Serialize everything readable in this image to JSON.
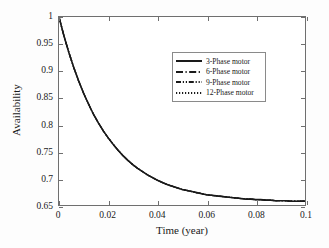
{
  "chart_data": {
    "type": "line",
    "title": "",
    "xlabel": "Time (year)",
    "ylabel": "Availability",
    "xlim": [
      0,
      0.1
    ],
    "ylim": [
      0.65,
      1
    ],
    "xticks": [
      0,
      0.02,
      0.04,
      0.06,
      0.08,
      0.1
    ],
    "xticklabels": [
      "0",
      "0.02",
      "0.04",
      "0.06",
      "0.08",
      "0.1"
    ],
    "yticks": [
      0.65,
      0.7,
      0.75,
      0.8,
      0.85,
      0.9,
      0.95,
      1
    ],
    "yticklabels": [
      "0.65",
      "0.7",
      "0.75",
      "0.8",
      "0.85",
      "0.9",
      "0.95",
      "1"
    ],
    "grid": false,
    "legend_position": "upper-center-right",
    "x": [
      0,
      0.002,
      0.004,
      0.006,
      0.008,
      0.01,
      0.012,
      0.014,
      0.016,
      0.018,
      0.02,
      0.022,
      0.024,
      0.026,
      0.028,
      0.03,
      0.032,
      0.034,
      0.036,
      0.038,
      0.04,
      0.042,
      0.044,
      0.046,
      0.048,
      0.05,
      0.052,
      0.054,
      0.056,
      0.058,
      0.06,
      0.062,
      0.064,
      0.066,
      0.068,
      0.07,
      0.072,
      0.074,
      0.076,
      0.078,
      0.08,
      0.082,
      0.084,
      0.086,
      0.088,
      0.09,
      0.092,
      0.094,
      0.096,
      0.098,
      0.1
    ],
    "series": [
      {
        "name": "3-Phase motor",
        "linestyle": "solid",
        "color": "#1a1a1a",
        "values": [
          1.0,
          0.965,
          0.934,
          0.906,
          0.881,
          0.858,
          0.838,
          0.819,
          0.803,
          0.788,
          0.775,
          0.763,
          0.752,
          0.742,
          0.733,
          0.725,
          0.718,
          0.712,
          0.706,
          0.701,
          0.696,
          0.692,
          0.688,
          0.685,
          0.682,
          0.679,
          0.677,
          0.675,
          0.673,
          0.671,
          0.669,
          0.668,
          0.667,
          0.666,
          0.665,
          0.664,
          0.663,
          0.662,
          0.661,
          0.661,
          0.66,
          0.66,
          0.659,
          0.659,
          0.658,
          0.658,
          0.658,
          0.657,
          0.657,
          0.657,
          0.657
        ]
      },
      {
        "name": "6-Phase motor",
        "linestyle": "dashdot",
        "color": "#1a1a1a",
        "values": [
          1.0,
          0.965,
          0.934,
          0.906,
          0.881,
          0.858,
          0.838,
          0.819,
          0.803,
          0.788,
          0.775,
          0.763,
          0.752,
          0.742,
          0.733,
          0.725,
          0.718,
          0.712,
          0.706,
          0.701,
          0.696,
          0.692,
          0.688,
          0.685,
          0.682,
          0.679,
          0.677,
          0.675,
          0.673,
          0.671,
          0.669,
          0.668,
          0.667,
          0.666,
          0.665,
          0.664,
          0.663,
          0.662,
          0.661,
          0.661,
          0.66,
          0.66,
          0.659,
          0.659,
          0.658,
          0.658,
          0.658,
          0.657,
          0.657,
          0.657,
          0.657
        ]
      },
      {
        "name": "9-Phase motor",
        "linestyle": "dashdotdot",
        "color": "#1a1a1a",
        "values": [
          1.0,
          0.965,
          0.934,
          0.906,
          0.881,
          0.858,
          0.838,
          0.819,
          0.803,
          0.788,
          0.775,
          0.763,
          0.752,
          0.742,
          0.733,
          0.725,
          0.718,
          0.712,
          0.706,
          0.701,
          0.696,
          0.692,
          0.688,
          0.685,
          0.682,
          0.679,
          0.677,
          0.675,
          0.673,
          0.671,
          0.669,
          0.668,
          0.667,
          0.666,
          0.665,
          0.664,
          0.663,
          0.662,
          0.661,
          0.661,
          0.66,
          0.66,
          0.659,
          0.659,
          0.658,
          0.658,
          0.658,
          0.657,
          0.657,
          0.657,
          0.657
        ]
      },
      {
        "name": "12-Phase motor",
        "linestyle": "dotted",
        "color": "#1a1a1a",
        "values": [
          1.0,
          0.965,
          0.934,
          0.906,
          0.881,
          0.858,
          0.838,
          0.819,
          0.803,
          0.788,
          0.775,
          0.763,
          0.752,
          0.742,
          0.733,
          0.725,
          0.718,
          0.712,
          0.706,
          0.701,
          0.696,
          0.692,
          0.688,
          0.685,
          0.682,
          0.679,
          0.677,
          0.675,
          0.673,
          0.671,
          0.669,
          0.668,
          0.667,
          0.666,
          0.665,
          0.664,
          0.663,
          0.662,
          0.661,
          0.661,
          0.66,
          0.66,
          0.659,
          0.659,
          0.658,
          0.658,
          0.658,
          0.657,
          0.657,
          0.657,
          0.657
        ]
      }
    ]
  },
  "axes": {
    "box_color": "#6f6f6f"
  }
}
